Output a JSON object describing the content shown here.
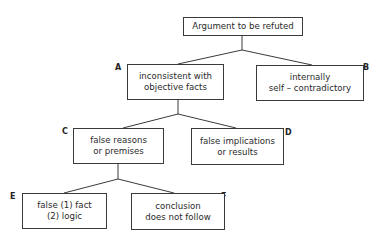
{
  "diagram": {
    "type": "tree",
    "nodes": {
      "root": {
        "lines": [
          "Argument to be refuted"
        ]
      },
      "A": {
        "label": "A",
        "lines": [
          "inconsistent with",
          "objective facts"
        ]
      },
      "B": {
        "label": "B",
        "lines": [
          "internally",
          "self – contradictory"
        ]
      },
      "C": {
        "label": "C",
        "lines": [
          "false reasons",
          "or premises"
        ]
      },
      "D": {
        "label": "D",
        "lines": [
          "false implications",
          "or results"
        ]
      },
      "E": {
        "label": "E",
        "lines": [
          "false (1) fact",
          "(2) logic"
        ]
      },
      "F": {
        "label": "F",
        "lines": [
          "conclusion",
          "does not follow"
        ]
      }
    },
    "edges": [
      [
        "root",
        "A"
      ],
      [
        "root",
        "B"
      ],
      [
        "A",
        "C"
      ],
      [
        "A",
        "D"
      ],
      [
        "C",
        "E"
      ],
      [
        "C",
        "F"
      ]
    ],
    "colors": {
      "line": "#3a3a3a",
      "background": "#ffffff",
      "text": "#2a2a2a"
    }
  }
}
